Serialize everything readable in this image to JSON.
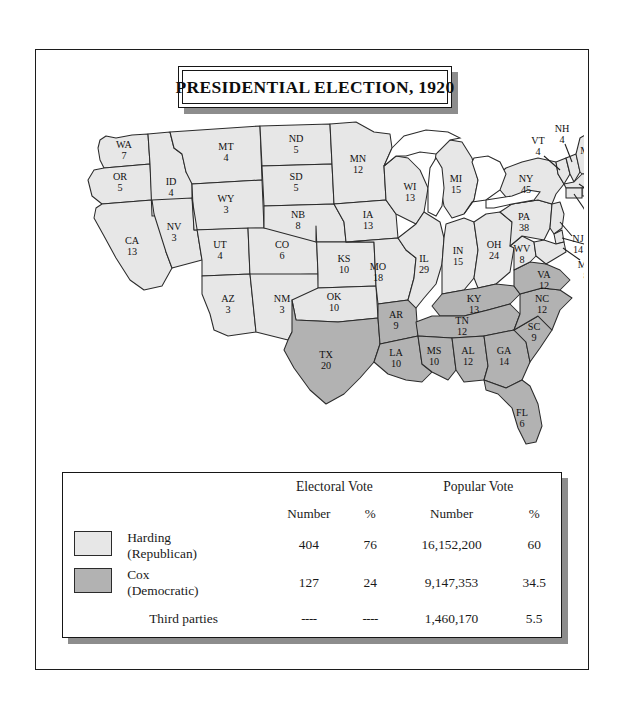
{
  "title": "PRESIDENTIAL ELECTION, 1920",
  "colors": {
    "harding": "#e7e7e7",
    "cox": "#b2b2b2",
    "water": "#ffffff",
    "border": "#2b2b2b",
    "frame": "#161616",
    "shadow": "#8d8d8d"
  },
  "legend": {
    "group_headers": {
      "electoral": "Electoral Vote",
      "popular": "Popular Vote"
    },
    "sub_headers": {
      "ev_number": "Number",
      "ev_pct": "%",
      "pv_number": "Number",
      "pv_pct": "%"
    },
    "rows": [
      {
        "candidate": "Harding",
        "party": "(Republican)",
        "swatch": "harding",
        "ev_number": "404",
        "ev_pct": "76",
        "pv_number": "16,152,200",
        "pv_pct": "60"
      },
      {
        "candidate": "Cox",
        "party": "(Democratic)",
        "swatch": "cox",
        "ev_number": "127",
        "ev_pct": "24",
        "pv_number": "9,147,353",
        "pv_pct": "34.5"
      },
      {
        "candidate": "Third parties",
        "party": "",
        "swatch": "none",
        "ev_number": "----",
        "ev_pct": "----",
        "pv_number": "1,460,170",
        "pv_pct": "5.5"
      }
    ]
  },
  "map": {
    "states": [
      {
        "code": "WA",
        "votes": "7",
        "party": "harding"
      },
      {
        "code": "OR",
        "votes": "5",
        "party": "harding"
      },
      {
        "code": "CA",
        "votes": "13",
        "party": "harding"
      },
      {
        "code": "ID",
        "votes": "4",
        "party": "harding"
      },
      {
        "code": "NV",
        "votes": "3",
        "party": "harding"
      },
      {
        "code": "MT",
        "votes": "4",
        "party": "harding"
      },
      {
        "code": "WY",
        "votes": "3",
        "party": "harding"
      },
      {
        "code": "UT",
        "votes": "4",
        "party": "harding"
      },
      {
        "code": "AZ",
        "votes": "3",
        "party": "harding"
      },
      {
        "code": "NM",
        "votes": "3",
        "party": "harding"
      },
      {
        "code": "CO",
        "votes": "6",
        "party": "harding"
      },
      {
        "code": "ND",
        "votes": "5",
        "party": "harding"
      },
      {
        "code": "SD",
        "votes": "5",
        "party": "harding"
      },
      {
        "code": "NB",
        "votes": "8",
        "party": "harding"
      },
      {
        "code": "KS",
        "votes": "10",
        "party": "harding"
      },
      {
        "code": "OK",
        "votes": "10",
        "party": "harding"
      },
      {
        "code": "TX",
        "votes": "20",
        "party": "cox"
      },
      {
        "code": "MN",
        "votes": "12",
        "party": "harding"
      },
      {
        "code": "IA",
        "votes": "13",
        "party": "harding"
      },
      {
        "code": "MO",
        "votes": "18",
        "party": "harding"
      },
      {
        "code": "AR",
        "votes": "9",
        "party": "cox"
      },
      {
        "code": "LA",
        "votes": "10",
        "party": "cox"
      },
      {
        "code": "WI",
        "votes": "13",
        "party": "harding"
      },
      {
        "code": "IL",
        "votes": "29",
        "party": "harding"
      },
      {
        "code": "MI",
        "votes": "15",
        "party": "harding"
      },
      {
        "code": "IN",
        "votes": "15",
        "party": "harding"
      },
      {
        "code": "OH",
        "votes": "24",
        "party": "harding"
      },
      {
        "code": "KY",
        "votes": "13",
        "party": "cox"
      },
      {
        "code": "TN",
        "votes": "12",
        "party": "cox"
      },
      {
        "code": "MS",
        "votes": "10",
        "party": "cox"
      },
      {
        "code": "AL",
        "votes": "12",
        "party": "cox"
      },
      {
        "code": "GA",
        "votes": "14",
        "party": "cox"
      },
      {
        "code": "FL",
        "votes": "6",
        "party": "cox"
      },
      {
        "code": "SC",
        "votes": "9",
        "party": "cox"
      },
      {
        "code": "NC",
        "votes": "12",
        "party": "cox"
      },
      {
        "code": "VA",
        "votes": "12",
        "party": "cox"
      },
      {
        "code": "WV",
        "votes": "8",
        "party": "harding"
      },
      {
        "code": "PA",
        "votes": "38",
        "party": "harding"
      },
      {
        "code": "NY",
        "votes": "45",
        "party": "harding"
      },
      {
        "code": "VT",
        "votes": "4",
        "party": "harding"
      },
      {
        "code": "NH",
        "votes": "4",
        "party": "harding"
      },
      {
        "code": "ME",
        "votes": "6",
        "party": "harding"
      },
      {
        "code": "MA",
        "votes": "18",
        "party": "harding"
      },
      {
        "code": "RI",
        "votes": "5",
        "party": "harding"
      },
      {
        "code": "CT",
        "votes": "7",
        "party": "harding"
      },
      {
        "code": "NJ",
        "votes": "14",
        "party": "harding"
      },
      {
        "code": "DE",
        "votes": "3",
        "party": "harding"
      },
      {
        "code": "MD",
        "votes": "8",
        "party": "harding"
      }
    ]
  }
}
